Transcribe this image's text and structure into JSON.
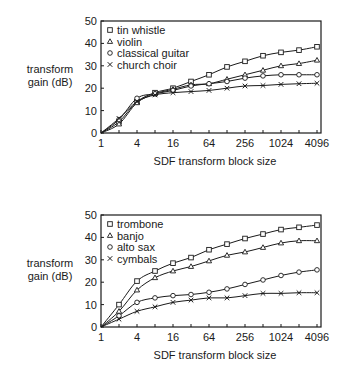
{
  "chart_data": [
    {
      "type": "line",
      "title": "",
      "xlabel": "SDF transform block size",
      "ylabel": "transform gain (dB)",
      "ylabel_lines": [
        "transform",
        "gain (dB)"
      ],
      "x_scale": "log2",
      "x": [
        1,
        2,
        4,
        8,
        16,
        32,
        64,
        128,
        256,
        512,
        1024,
        2048,
        4096
      ],
      "x_tick_labels": [
        "1",
        "4",
        "16",
        "64",
        "256",
        "1024",
        "4096"
      ],
      "x_tick_label_values": [
        1,
        4,
        16,
        64,
        256,
        1024,
        4096
      ],
      "y_ticks": [
        0,
        10,
        20,
        30,
        40,
        50
      ],
      "ylim": [
        0,
        50
      ],
      "grid": false,
      "legend_position": "upper-left-inside",
      "series": [
        {
          "name": "tin whistle",
          "marker": "square",
          "values": [
            0,
            5,
            14,
            18,
            20,
            23,
            26,
            29.5,
            32,
            34.5,
            36,
            37,
            38.5
          ]
        },
        {
          "name": "violin",
          "marker": "triangle",
          "values": [
            0,
            4,
            13.5,
            17.5,
            19.5,
            21.5,
            22,
            24,
            26,
            28,
            30,
            31,
            32.5
          ]
        },
        {
          "name": "classical guitar",
          "marker": "circle",
          "values": [
            0,
            6,
            15.5,
            17.5,
            19,
            21,
            22,
            23,
            24.5,
            25.5,
            26,
            26,
            26
          ]
        },
        {
          "name": "church choir",
          "marker": "x",
          "values": [
            0,
            6.5,
            14,
            17,
            18,
            18.5,
            19,
            20,
            21,
            21.2,
            21.7,
            22,
            22.2
          ]
        }
      ]
    },
    {
      "type": "line",
      "title": "",
      "xlabel": "SDF transform block size",
      "ylabel": "transform gain (dB)",
      "ylabel_lines": [
        "transform",
        "gain (dB)"
      ],
      "x_scale": "log2",
      "x": [
        1,
        2,
        4,
        8,
        16,
        32,
        64,
        128,
        256,
        512,
        1024,
        2048,
        4096
      ],
      "x_tick_labels": [
        "1",
        "4",
        "16",
        "64",
        "256",
        "1024",
        "4096"
      ],
      "x_tick_label_values": [
        1,
        4,
        16,
        64,
        256,
        1024,
        4096
      ],
      "y_ticks": [
        0,
        10,
        20,
        30,
        40,
        50
      ],
      "ylim": [
        0,
        50
      ],
      "grid": false,
      "legend_position": "upper-left-inside",
      "series": [
        {
          "name": "trombone",
          "marker": "square",
          "values": [
            0,
            10,
            20.5,
            25,
            28.5,
            31,
            34.5,
            37,
            39.5,
            41.5,
            43.5,
            44.5,
            45.5
          ]
        },
        {
          "name": "banjo",
          "marker": "triangle",
          "values": [
            0,
            7,
            16.5,
            22,
            25,
            27,
            29.5,
            32,
            33.5,
            35.5,
            37.5,
            38.5,
            38.5
          ]
        },
        {
          "name": "alto sax",
          "marker": "circle",
          "values": [
            0,
            5,
            11,
            13,
            14,
            14.5,
            15.5,
            17,
            19,
            21,
            23,
            24.5,
            25.5
          ]
        },
        {
          "name": "cymbals",
          "marker": "x",
          "values": [
            0,
            3.5,
            7,
            9,
            11,
            12,
            13,
            13,
            14,
            15,
            15,
            15.3,
            15.3
          ]
        }
      ]
    }
  ],
  "colors": {
    "ink": "#1a1a1a",
    "background": "#ffffff"
  }
}
